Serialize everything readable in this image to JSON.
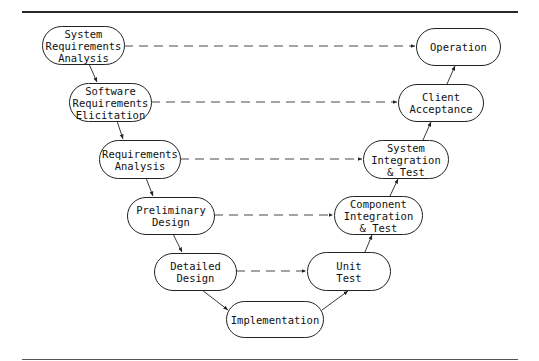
{
  "diagram": {
    "type": "V-model",
    "left_nodes": [
      {
        "id": "sra",
        "label": "System\nRequirements\nAnalysis"
      },
      {
        "id": "sre",
        "label": "Software\nRequirements\nElicitation"
      },
      {
        "id": "ra",
        "label": "Requirements\nAnalysis"
      },
      {
        "id": "pd",
        "label": "Preliminary\nDesign"
      },
      {
        "id": "dd",
        "label": "Detailed\nDesign"
      }
    ],
    "bottom_node": {
      "id": "impl",
      "label": "Implementation"
    },
    "right_nodes": [
      {
        "id": "ut",
        "label": "Unit\nTest"
      },
      {
        "id": "cit",
        "label": "Component\nIntegration\n& Test"
      },
      {
        "id": "sit",
        "label": "System\nIntegration\n& Test"
      },
      {
        "id": "ca",
        "label": "Client\nAcceptance"
      },
      {
        "id": "op",
        "label": "Operation"
      }
    ],
    "solid_edges": [
      [
        "sra",
        "sre"
      ],
      [
        "sre",
        "ra"
      ],
      [
        "ra",
        "pd"
      ],
      [
        "pd",
        "dd"
      ],
      [
        "dd",
        "impl"
      ],
      [
        "impl",
        "ut"
      ],
      [
        "ut",
        "cit"
      ],
      [
        "cit",
        "sit"
      ],
      [
        "sit",
        "ca"
      ],
      [
        "ca",
        "op"
      ]
    ],
    "dashed_edges": [
      [
        "sra",
        "op"
      ],
      [
        "sre",
        "ca"
      ],
      [
        "ra",
        "sit"
      ],
      [
        "pd",
        "cit"
      ],
      [
        "dd",
        "ut"
      ]
    ]
  }
}
